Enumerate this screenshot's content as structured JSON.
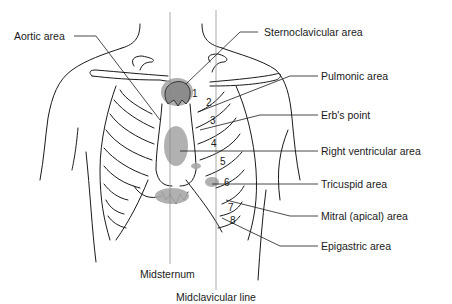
{
  "figure": {
    "labels": {
      "aortic": "Aortic area",
      "sternoclavicular": "Sternoclavicular area",
      "pulmonic": "Pulmonic area",
      "erbs": "Erb's point",
      "right_ventricular": "Right ventricular area",
      "tricuspid": "Tricuspid area",
      "mitral": "Mitral (apical) area",
      "epigastric": "Epigastric area",
      "midsternum": "Midsternum",
      "midclavicular": "Midclavicular line"
    },
    "intercostal_numbers": [
      "1",
      "2",
      "3",
      "4",
      "5",
      "6",
      "7",
      "8"
    ],
    "colors": {
      "line": "#1a1a1a",
      "area_fill": "#a9a9a9",
      "guide_line": "#888888"
    }
  }
}
